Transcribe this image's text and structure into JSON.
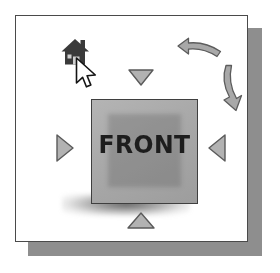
{
  "figure": {
    "background_color": "#ffffff",
    "panel_border_color": "#4a4a4a",
    "panel_shadow_color": "#8e8e8e"
  },
  "cube": {
    "face_label": "FRONT",
    "face_fill_color": "#a9a9a9",
    "face_border_color": "#3f3f3f",
    "label_color": "#1d1d1d",
    "has_ground_shadow": true
  },
  "nav_arrows": [
    {
      "name": "arrow-top",
      "icon": "triangle-down-icon",
      "direction": "down",
      "fill": "#b0b0b0",
      "stroke": "#555555"
    },
    {
      "name": "arrow-bottom",
      "icon": "triangle-up-icon",
      "direction": "up",
      "fill": "#b0b0b0",
      "stroke": "#555555"
    },
    {
      "name": "arrow-left",
      "icon": "triangle-right-icon",
      "direction": "right",
      "fill": "#b0b0b0",
      "stroke": "#555555"
    },
    {
      "name": "arrow-right",
      "icon": "triangle-left-icon",
      "direction": "left",
      "fill": "#b0b0b0",
      "stroke": "#555555"
    }
  ],
  "rotation_arrows": [
    {
      "name": "rotate-counterclockwise",
      "icon": "curved-arrow-left-icon",
      "fill": "#a8a8a8",
      "stroke": "#5a5a5a"
    },
    {
      "name": "rotate-clockwise",
      "icon": "curved-arrow-down-icon",
      "fill": "#a8a8a8",
      "stroke": "#5a5a5a"
    }
  ],
  "home_button": {
    "icon": "home-icon",
    "fill": "#3a3a3a"
  },
  "pointer": {
    "icon": "mouse-cursor-icon",
    "fill": "#ffffff",
    "stroke": "#1a1a1a",
    "hovering": "home-button"
  }
}
